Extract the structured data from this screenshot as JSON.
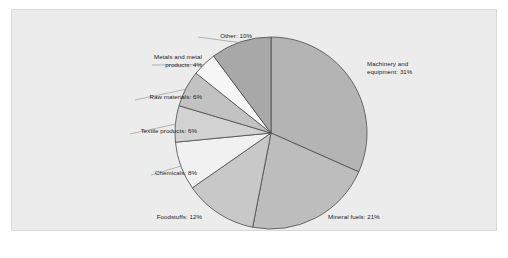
{
  "figure": {
    "panel_background": "#ececec",
    "panel_border": "#d9d9d9",
    "page_background": "#ffffff"
  },
  "chart_data": {
    "type": "pie",
    "title": "",
    "subtitle": "",
    "xlabel": "",
    "ylabel": "",
    "grid": false,
    "legend_position": "none",
    "labels_position": "outside-with-leader",
    "start_angle_deg": 0,
    "direction": "clockwise",
    "units": "percent",
    "total": 98,
    "categories": [
      "Machinery and equipment",
      "Mineral fuels",
      "Foodstuffs",
      "Chemicals",
      "Textile products",
      "Raw materials",
      "Metals and metal products",
      "Other"
    ],
    "values": [
      31,
      21,
      12,
      8,
      6,
      6,
      4,
      10
    ],
    "colors": [
      "#b4b4b4",
      "#bdbdbd",
      "#c8c8c8",
      "#f1f1f1",
      "#d2d2d2",
      "#c2c2c2",
      "#f6f6f6",
      "#a8a8a8"
    ],
    "slice_outline_color": "#4a4a4a",
    "slices": [
      {
        "name": "Machinery and equipment",
        "value": 31,
        "label_line1": "Machinery and",
        "label_line2": "equipment: 31%",
        "label_text": "Machinery and equipment: 31%",
        "color": "#b4b4b4"
      },
      {
        "name": "Mineral fuels",
        "value": 21,
        "label_line1": "Mineral fuels: 21%",
        "label_line2": "",
        "label_text": "Mineral fuels: 21%",
        "color": "#bdbdbd"
      },
      {
        "name": "Foodstuffs",
        "value": 12,
        "label_line1": "Foodstuffs: 12%",
        "label_line2": "",
        "label_text": "Foodstuffs: 12%",
        "color": "#c8c8c8"
      },
      {
        "name": "Chemicals",
        "value": 8,
        "label_line1": "Chemicals: 8%",
        "label_line2": "",
        "label_text": "Chemicals: 8%",
        "color": "#f1f1f1"
      },
      {
        "name": "Textile products",
        "value": 6,
        "label_line1": "Textile products: 6%",
        "label_line2": "",
        "label_text": "Textile products: 6%",
        "color": "#d2d2d2"
      },
      {
        "name": "Raw materials",
        "value": 6,
        "label_line1": "Raw materials: 6%",
        "label_line2": "",
        "label_text": "Raw materials: 6%",
        "color": "#c2c2c2"
      },
      {
        "name": "Metals and metal products",
        "value": 4,
        "label_line1": "Metals and metal",
        "label_line2": "products: 4%",
        "label_text": "Metals and metal products: 4%",
        "color": "#f6f6f6"
      },
      {
        "name": "Other",
        "value": 10,
        "label_line1": "Other: 10%",
        "label_line2": "",
        "label_text": "Other: 10%",
        "color": "#a8a8a8"
      }
    ]
  },
  "caption": {
    "text": ""
  }
}
